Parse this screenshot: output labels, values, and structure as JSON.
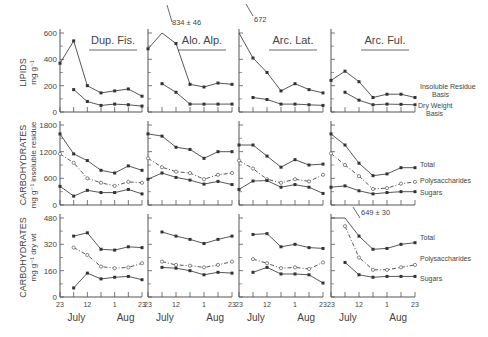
{
  "figure": {
    "row_labels": [
      {
        "main": "LIPIDS",
        "sub": "mg g⁻¹"
      },
      {
        "main": "CARBOHYDRATES",
        "sub": "mg g⁻¹ insoluble residue"
      },
      {
        "main": "CARBOHYDRATES",
        "sub": "mg g⁻¹ dry wt"
      }
    ],
    "x_tick_labels": [
      "23",
      "12",
      "1",
      "23"
    ],
    "month_labels": [
      "July",
      "Aug"
    ],
    "panel_titles": [
      "Dup. Fis.",
      "Alo. Alp.",
      "Arc. Lat.",
      "Arc. Ful."
    ],
    "annotations": {
      "alo_alp_lipid_peak": "834 ± 46",
      "arc_lat_lipid_peak": "672",
      "arc_ful_carb_dry_peak": "649 ± 30"
    },
    "legend_row1": [
      "Insoluble Residue Basis",
      "Dry Weight Basis"
    ],
    "legend_row2": [
      "Total",
      "Polysaccharides",
      "Sugars"
    ],
    "legend_row3": [
      "Total",
      "Polysaccharides",
      "Sugars"
    ]
  },
  "chart_data": [
    {
      "type": "line",
      "title": "Lipids (mg g⁻¹)",
      "ylabel": "LIPIDS mg g⁻¹",
      "ylim": [
        0,
        600
      ],
      "yticks": [
        0,
        200,
        400,
        600
      ],
      "x": [
        "Jun 23",
        "Jul 2",
        "Jul 12",
        "Jul 22",
        "Aug 1",
        "Aug 11",
        "Aug 21"
      ],
      "panels": [
        {
          "name": "Dup. Fis.",
          "series": [
            {
              "name": "Insoluble Residue Basis",
              "values": [
                370,
                540,
                200,
                145,
                160,
                175,
                120
              ]
            },
            {
              "name": "Dry Weight Basis",
              "values": [
                null,
                170,
                80,
                50,
                60,
                55,
                45
              ]
            }
          ]
        },
        {
          "name": "Alo. Alp.",
          "series": [
            {
              "name": "Insoluble Residue Basis",
              "values": [
                480,
                834,
                520,
                210,
                190,
                220,
                210
              ]
            },
            {
              "name": "Dry Weight Basis",
              "values": [
                null,
                215,
                150,
                60,
                60,
                60,
                60
              ]
            }
          ]
        },
        {
          "name": "Arc. Lat.",
          "series": [
            {
              "name": "Insoluble Residue Basis",
              "values": [
                672,
                410,
                300,
                160,
                215,
                170,
                145
              ]
            },
            {
              "name": "Dry Weight Basis",
              "values": [
                null,
                110,
                95,
                60,
                60,
                55,
                50
              ]
            }
          ]
        },
        {
          "name": "Arc. Ful.",
          "series": [
            {
              "name": "Insoluble Residue Basis",
              "values": [
                240,
                310,
                230,
                110,
                135,
                135,
                110
              ]
            },
            {
              "name": "Dry Weight Basis",
              "values": [
                null,
                150,
                90,
                55,
                60,
                58,
                55
              ]
            }
          ]
        }
      ]
    },
    {
      "type": "line",
      "title": "Carbohydrates (mg g⁻¹ insoluble residue)",
      "ylabel": "CARBOHYDRATES mg g⁻¹ insoluble residue",
      "ylim": [
        0,
        1800
      ],
      "yticks": [
        0,
        600,
        1200,
        1800
      ],
      "x": [
        "Jun 23",
        "Jul 2",
        "Jul 12",
        "Jul 22",
        "Aug 1",
        "Aug 11",
        "Aug 21"
      ],
      "panels": [
        {
          "name": "Dup. Fis.",
          "series": [
            {
              "name": "Total",
              "values": [
                1600,
                1150,
                1000,
                780,
                720,
                880,
                780
              ]
            },
            {
              "name": "Polysaccharides",
              "values": [
                1150,
                950,
                600,
                500,
                430,
                520,
                500
              ]
            },
            {
              "name": "Sugars",
              "values": [
                420,
                200,
                330,
                280,
                280,
                350,
                250
              ]
            }
          ]
        },
        {
          "name": "Alo. Alp.",
          "series": [
            {
              "name": "Total",
              "values": [
                1600,
                1550,
                1300,
                1250,
                1050,
                1200,
                1200
              ]
            },
            {
              "name": "Polysaccharides",
              "values": [
                1050,
                850,
                750,
                720,
                580,
                680,
                720
              ]
            },
            {
              "name": "Sugars",
              "values": [
                580,
                720,
                620,
                560,
                470,
                530,
                460
              ]
            }
          ]
        },
        {
          "name": "Arc. Lat.",
          "series": [
            {
              "name": "Total",
              "values": [
                1350,
                1350,
                1100,
                850,
                1020,
                900,
                920
              ]
            },
            {
              "name": "Polysaccharides",
              "values": [
                1000,
                820,
                580,
                500,
                580,
                530,
                680
              ]
            },
            {
              "name": "Sugars",
              "values": [
                350,
                540,
                550,
                400,
                460,
                400,
                260
              ]
            }
          ]
        },
        {
          "name": "Arc. Ful.",
          "series": [
            {
              "name": "Total",
              "values": [
                1600,
                1350,
                940,
                660,
                700,
                840,
                840
              ]
            },
            {
              "name": "Polysaccharides",
              "values": [
                1160,
                900,
                650,
                360,
                380,
                480,
                520
              ]
            },
            {
              "name": "Sugars",
              "values": [
                400,
                430,
                320,
                250,
                280,
                300,
                300
              ]
            }
          ]
        }
      ]
    },
    {
      "type": "line",
      "title": "Carbohydrates (mg g⁻¹ dry wt)",
      "ylabel": "CARBOHYDRATES mg g⁻¹ dry wt",
      "ylim": [
        0,
        480
      ],
      "yticks": [
        0,
        160,
        320,
        480
      ],
      "x": [
        "Jun 23",
        "Jul 2",
        "Jul 12",
        "Jul 22",
        "Aug 1",
        "Aug 11",
        "Aug 21"
      ],
      "xtick_labels": [
        "23",
        "12",
        "1",
        "23"
      ],
      "months": [
        "July",
        "Aug"
      ],
      "panels": [
        {
          "name": "Dup. Fis.",
          "series": [
            {
              "name": "Total",
              "values": [
                null,
                370,
                390,
                290,
                285,
                305,
                300
              ]
            },
            {
              "name": "Polysaccharides",
              "values": [
                null,
                300,
                255,
                185,
                175,
                180,
                205
              ]
            },
            {
              "name": "Sugars",
              "values": [
                null,
                55,
                145,
                110,
                120,
                125,
                105
              ]
            }
          ]
        },
        {
          "name": "Alo. Alp.",
          "series": [
            {
              "name": "Total",
              "values": [
                null,
                395,
                370,
                350,
                325,
                350,
                370
              ]
            },
            {
              "name": "Polysaccharides",
              "values": [
                null,
                215,
                195,
                190,
                180,
                195,
                215
              ]
            },
            {
              "name": "Sugars",
              "values": [
                null,
                180,
                175,
                160,
                135,
                150,
                145
              ]
            }
          ]
        },
        {
          "name": "Arc. Lat.",
          "series": [
            {
              "name": "Total",
              "values": [
                null,
                380,
                385,
                305,
                320,
                300,
                295
              ]
            },
            {
              "name": "Polysaccharides",
              "values": [
                null,
                230,
                205,
                175,
                180,
                170,
                210
              ]
            },
            {
              "name": "Sugars",
              "values": [
                null,
                150,
                180,
                140,
                140,
                135,
                85
              ]
            }
          ]
        },
        {
          "name": "Arc. Ful.",
          "series": [
            {
              "name": "Total",
              "values": [
                649,
                500,
                370,
                290,
                295,
                320,
                330
              ]
            },
            {
              "name": "Polysaccharides",
              "values": [
                null,
                430,
                240,
                165,
                165,
                180,
                195
              ]
            },
            {
              "name": "Sugars",
              "values": [
                null,
                210,
                135,
                120,
                125,
                125,
                125
              ]
            }
          ]
        }
      ]
    }
  ]
}
